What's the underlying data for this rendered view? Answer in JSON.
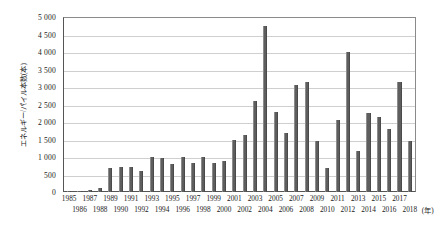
{
  "chart_data": {
    "type": "bar",
    "title": "",
    "xlabel": "(年)",
    "ylabel": "エネルギー/パイル本数(本)",
    "ylim": [
      0,
      5000
    ],
    "ytick_step": 500,
    "grid": true,
    "legend": "none",
    "bar_color": "#5e5e5e",
    "axis_color": "#555555",
    "grid_color": "#cfcfcf",
    "ytick_labels": [
      "0",
      "500",
      "1 000",
      "1 500",
      "2 000",
      "2 500",
      "3 000",
      "3 500",
      "4 000",
      "4 500",
      "5 000"
    ],
    "ytick_values": [
      0,
      500,
      1000,
      1500,
      2000,
      2500,
      3000,
      3500,
      4000,
      4500,
      5000
    ],
    "categories": [
      "1985",
      "1986",
      "1987",
      "1988",
      "1989",
      "1990",
      "1991",
      "1992",
      "1993",
      "1994",
      "1995",
      "1996",
      "1997",
      "1998",
      "1999",
      "2000",
      "2001",
      "2002",
      "2003",
      "2004",
      "2005",
      "2006",
      "2007",
      "2008",
      "2009",
      "2010",
      "2011",
      "2012",
      "2013",
      "2014",
      "2015",
      "2016",
      "2017",
      "2018"
    ],
    "values": [
      10,
      15,
      60,
      110,
      680,
      710,
      705,
      590,
      1000,
      980,
      790,
      1000,
      830,
      990,
      840,
      890,
      1500,
      1640,
      2600,
      4750,
      2300,
      1700,
      3050,
      3150,
      1450,
      700,
      2050,
      4000,
      1180,
      2250,
      2150,
      1800,
      3150,
      1450
    ],
    "xtick_rows": [
      [
        "1985",
        "1987",
        "1989",
        "1991",
        "1993",
        "1995",
        "1997",
        "1999",
        "2001",
        "2003",
        "2005",
        "2007",
        "2009",
        "2011",
        "2013",
        "2015",
        "2017"
      ],
      [
        "1986",
        "1988",
        "1990",
        "1992",
        "1994",
        "1996",
        "1998",
        "2000",
        "2002",
        "2004",
        "2006",
        "2008",
        "2010",
        "2012",
        "2014",
        "2016",
        "2018"
      ]
    ]
  }
}
